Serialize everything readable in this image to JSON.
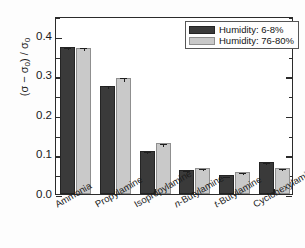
{
  "chart_data": {
    "type": "bar",
    "title": "",
    "xlabel": "",
    "ylabel": "(σ − σ₀) / σ₀",
    "ylim": [
      0.0,
      0.45
    ],
    "yticks": [
      "0.0",
      "0.1",
      "0.2",
      "0.3",
      "0.4"
    ],
    "ytick_values": [
      0.0,
      0.1,
      0.2,
      0.3,
      0.4
    ],
    "y_minor_interval": 0.05,
    "grid": false,
    "legend_position": "upper right",
    "categories": [
      "Ammonia",
      "Propylamine",
      "Isopropylamine",
      "n-Butylamine",
      "t-Butylamine",
      "Cyclohexylamine"
    ],
    "series": [
      {
        "name": "Humidity: 6-8%",
        "color": "#3a3a3a",
        "values": [
          0.372,
          0.274,
          0.109,
          0.061,
          0.047,
          0.081
        ],
        "errors": [
          0.003,
          0.003,
          0.003,
          0.002,
          0.002,
          0.002
        ]
      },
      {
        "name": "Humidity: 76-80%",
        "color": "#c9c9c9",
        "values": [
          0.37,
          0.293,
          0.128,
          0.065,
          0.055,
          0.065
        ],
        "errors": [
          0.003,
          0.006,
          0.003,
          0.002,
          0.002,
          0.002
        ]
      }
    ]
  },
  "legend": {
    "entries": [
      {
        "label": "Humidity: 6-8%",
        "swatch": "dark"
      },
      {
        "label": "Humidity: 76-80%",
        "swatch": "light"
      }
    ]
  },
  "colors": {
    "series_dark": "#3a3a3a",
    "series_light": "#c9c9c9",
    "axis": "#2b2b2b",
    "text": "#1a1a1a",
    "background": "#ffffff"
  }
}
